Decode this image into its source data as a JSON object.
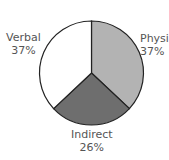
{
  "chart_data": {
    "type": "pie",
    "title": "",
    "categories": [
      "Physical",
      "Indirect",
      "Verbal"
    ],
    "values": [
      37,
      26,
      37
    ],
    "labels": [
      {
        "name": "Physi",
        "pct": "37%"
      },
      {
        "name": "Indirect",
        "pct": "26%"
      },
      {
        "name": "Verbal",
        "pct": "37%"
      }
    ],
    "colors": [
      "#b3b3b3",
      "#6e6e6e",
      "#ffffff"
    ],
    "start_angle": "12 o'clock, clockwise"
  }
}
